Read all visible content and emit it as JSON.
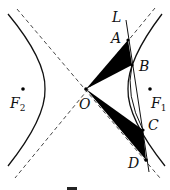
{
  "diagram": {
    "type": "hyperbola-geometry",
    "points": {
      "O": {
        "label": "O",
        "x": 86,
        "y": 89
      },
      "A": {
        "label": "A",
        "x": 128,
        "y": 40
      },
      "B": {
        "label": "B",
        "x": 132,
        "y": 65
      },
      "C": {
        "label": "C",
        "x": 143,
        "y": 130
      },
      "D": {
        "label": "D",
        "x": 146,
        "y": 160
      },
      "F1": {
        "label": "F",
        "sub": "1",
        "x": 150,
        "y": 89
      },
      "F2": {
        "label": "F",
        "sub": "2",
        "x": 23,
        "y": 89
      }
    },
    "line_label": "L",
    "shaded_triangles": [
      "OAB",
      "OCD"
    ],
    "caption": "图"
  },
  "colors": {
    "stroke": "#111111",
    "fill": "#000000",
    "background": "#ffffff"
  }
}
